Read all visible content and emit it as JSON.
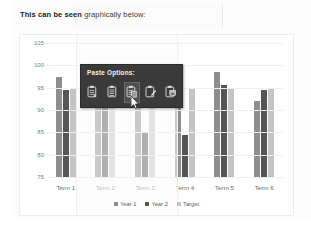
{
  "document": {
    "intro_bold": "This can be seen",
    "intro_rest": " graphically below:"
  },
  "paste_popup": {
    "title": "Paste Options:",
    "options": [
      {
        "name": "keep-source-formatting",
        "icon": "clipboard-source-formatting-icon"
      },
      {
        "name": "keep-text-only",
        "icon": "clipboard-text-only-icon"
      },
      {
        "name": "use-destination-theme",
        "icon": "clipboard-destination-theme-icon"
      },
      {
        "name": "merge-formatting",
        "icon": "clipboard-merge-formatting-icon"
      },
      {
        "name": "picture",
        "icon": "clipboard-picture-icon"
      }
    ],
    "active_index": 2
  },
  "colors": {
    "year1": "#8e8e8e",
    "year2": "#555555",
    "target": "#c4c4c4",
    "popup_bg": "#3a3a3a",
    "grid": "#f0f0f0"
  },
  "chart_data": {
    "type": "bar",
    "title": "",
    "xlabel": "",
    "ylabel": "",
    "ylim": [
      75,
      105
    ],
    "yticks": [
      75,
      80,
      85,
      90,
      95,
      100,
      105
    ],
    "grid": true,
    "legend_position": "bottom",
    "categories": [
      "Term 1",
      "Term 2",
      "Term 3",
      "Term 4",
      "Term 5",
      "Term 6"
    ],
    "series": [
      {
        "name": "Year 1",
        "values": [
          97.5,
          95.5,
          95.5,
          95.0,
          98.5,
          92.0
        ]
      },
      {
        "name": "Year 2",
        "values": [
          94.5,
          95.5,
          85.0,
          84.5,
          95.5,
          94.5
        ]
      },
      {
        "name": "Target",
        "values": [
          95.0,
          95.0,
          95.0,
          95.0,
          95.0,
          95.0
        ]
      }
    ]
  }
}
